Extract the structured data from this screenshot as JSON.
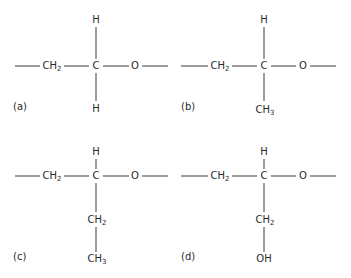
{
  "panels": [
    {
      "id": "a",
      "label": "(a)",
      "chain_left": "CH",
      "chain_left_sub": "2",
      "center": "C",
      "right": "O",
      "top": "H",
      "bottom": "H",
      "bottom_sub": "",
      "bottom2": "",
      "bottom2_sub": ""
    },
    {
      "id": "b",
      "label": "(b)",
      "chain_left": "CH",
      "chain_left_sub": "2",
      "center": "C",
      "right": "O",
      "top": "H",
      "bottom": "CH",
      "bottom_sub": "3",
      "bottom2": "",
      "bottom2_sub": ""
    },
    {
      "id": "c",
      "label": "(c)",
      "chain_left": "CH",
      "chain_left_sub": "2",
      "center": "C",
      "right": "O",
      "top": "H",
      "bottom": "CH",
      "bottom_sub": "2",
      "bottom2": "CH",
      "bottom2_sub": "3"
    },
    {
      "id": "d",
      "label": "(d)",
      "chain_left": "CH",
      "chain_left_sub": "2",
      "center": "C",
      "right": "O",
      "top": "H",
      "bottom": "CH",
      "bottom_sub": "2",
      "bottom2": "OH",
      "bottom2_sub": ""
    }
  ],
  "colors": {
    "ink": "#3a3a3a",
    "background": "#ffffff"
  }
}
